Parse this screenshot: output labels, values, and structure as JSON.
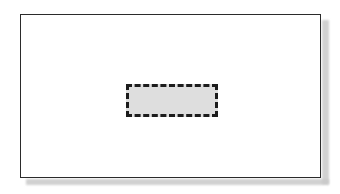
{
  "diagram": {
    "background_color": "#ffffff",
    "canvas": {
      "label": "diagram-canvas",
      "width": 340,
      "height": 194
    },
    "outer_frame": {
      "label": "page frame",
      "shape": "rectangle",
      "fill_color": "#ffffff",
      "border_color": "#2b2b2b",
      "border_width_px": 1.5,
      "border_style": "solid",
      "x": 20,
      "y": 14,
      "width": 301,
      "height": 164,
      "text": ""
    },
    "shadow": {
      "label": "drop shadow",
      "color": "#c9c9c9",
      "offset_x_px": 7,
      "offset_y_px": 6
    },
    "dashed_box": {
      "label": "selected region",
      "shape": "rectangle",
      "fill_color": "#dedede",
      "border_color": "#1c1c1c",
      "border_width_px": 3,
      "border_style": "dashed",
      "x": 126,
      "y": 84,
      "width": 92,
      "height": 33,
      "text": ""
    }
  }
}
